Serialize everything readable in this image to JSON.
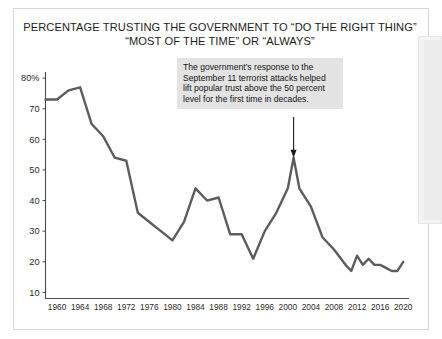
{
  "title": {
    "line1": "PERCENTAGE TRUSTING THE GOVERNMENT TO “DO THE RIGHT THING”",
    "line2": "“MOST OF THE TIME” OR “ALWAYS”"
  },
  "annotation": {
    "line1": "The government’s response to the",
    "line2": "September 11 terrorist attacks helped",
    "line3": "lift popular trust above the 50 percent",
    "line4": "level for the first time in decades."
  },
  "axes": {
    "y_ticks": [
      "80%",
      "70",
      "60",
      "50",
      "40",
      "30",
      "20",
      "10"
    ],
    "x_ticks": [
      "1960",
      "1964",
      "1968",
      "1972",
      "1976",
      "1980",
      "1984",
      "1988",
      "1992",
      "1996",
      "2000",
      "2004",
      "2008",
      "2012",
      "2016",
      "2020"
    ]
  },
  "colors": {
    "line": "#5c5c5c",
    "axis": "#4a4a4a",
    "annotation_bg": "#e3e3e3",
    "frame": "#d8d8d8"
  },
  "chart_data": {
    "type": "line",
    "title": "PERCENTAGE TRUSTING THE GOVERNMENT TO “DO THE RIGHT THING” “MOST OF THE TIME” OR “ALWAYS”",
    "xlabel": "",
    "ylabel": "",
    "xlim": [
      1958,
      2021
    ],
    "ylim": [
      8,
      82
    ],
    "grid": false,
    "legend": false,
    "yticks": [
      10,
      20,
      30,
      40,
      50,
      60,
      70,
      80
    ],
    "ytick_labels": [
      "10",
      "20",
      "30",
      "40",
      "50",
      "60",
      "70",
      "80%"
    ],
    "xticks": [
      1960,
      1964,
      1968,
      1972,
      1976,
      1980,
      1984,
      1988,
      1992,
      1996,
      2000,
      2004,
      2008,
      2012,
      2016,
      2020
    ],
    "series": [
      {
        "name": "Trust in government",
        "x": [
          1958,
          1960,
          1962,
          1964,
          1966,
          1968,
          1970,
          1972,
          1974,
          1976,
          1978,
          1980,
          1982,
          1984,
          1986,
          1988,
          1990,
          1992,
          1994,
          1996,
          1998,
          2000,
          2001,
          2002,
          2004,
          2006,
          2008,
          2010,
          2011,
          2012,
          2013,
          2014,
          2015,
          2016,
          2017,
          2018,
          2019,
          2020
        ],
        "values": [
          73,
          73,
          76,
          77,
          65,
          61,
          54,
          53,
          36,
          33,
          30,
          27,
          33,
          44,
          40,
          41,
          29,
          29,
          21,
          30,
          36,
          44,
          54,
          44,
          38,
          28,
          24,
          19,
          17,
          22,
          19,
          21,
          19,
          19,
          18,
          17,
          17,
          20
        ]
      }
    ],
    "annotations": [
      {
        "text": "The government’s response to the September 11 terrorist attacks helped lift popular trust above the 50 percent level for the first time in decades.",
        "points_to_x": 2001,
        "points_to_y": 54
      }
    ]
  }
}
